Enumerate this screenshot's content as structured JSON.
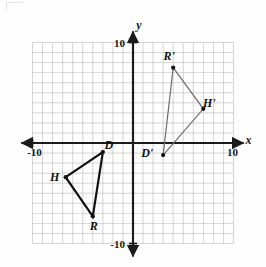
{
  "figure": {
    "type": "coordinate-plane",
    "axes": {
      "x_label": "x",
      "y_label": "y",
      "x_min_label": "-10",
      "x_max_label": "10",
      "y_min_label": "-10",
      "y_max_label": "10",
      "x_range": [
        -10,
        10
      ],
      "y_range": [
        -10,
        10
      ],
      "grid": true,
      "grid_step": 1,
      "grid_color": "#b9b9b9",
      "axis_color": "#1b1b1b"
    },
    "shapes": [
      {
        "name": "triangle-hdr",
        "role": "preimage",
        "stroke": "#111111",
        "stroke_width": 2.2,
        "vertices": [
          {
            "label": "H",
            "x": -6.7,
            "y": -3.4,
            "label_dx": -11,
            "label_dy": 4
          },
          {
            "label": "D",
            "x": -3.0,
            "y": -0.9,
            "label_dx": 6,
            "label_dy": -3
          },
          {
            "label": "R",
            "x": -4.0,
            "y": -7.3,
            "label_dx": 1,
            "label_dy": 14
          }
        ]
      },
      {
        "name": "triangle-hdr-prime",
        "role": "image",
        "stroke": "#6b6b6b",
        "stroke_width": 1.2,
        "vertices": [
          {
            "label": "R'",
            "x": 4.0,
            "y": 7.5,
            "label_dx": -4,
            "label_dy": -8
          },
          {
            "label": "H'",
            "x": 7.0,
            "y": 3.4,
            "label_dx": 6,
            "label_dy": -2
          },
          {
            "label": "D'",
            "x": 3.0,
            "y": -1.2,
            "label_dx": -16,
            "label_dy": 2
          }
        ]
      }
    ]
  }
}
